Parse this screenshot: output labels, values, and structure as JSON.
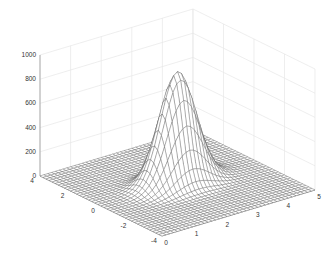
{
  "chart_data": {
    "type": "surface3d",
    "title": "",
    "xlabel": "",
    "ylabel": "",
    "zlabel": "",
    "xlim": [
      0,
      5
    ],
    "ylim": [
      -4,
      4
    ],
    "zlim": [
      0,
      1000
    ],
    "x_ticks": [
      0,
      1,
      2,
      3,
      4,
      5
    ],
    "y_ticks": [
      -4,
      -2,
      0,
      2,
      4
    ],
    "z_ticks": [
      0,
      200,
      400,
      600,
      800,
      1000
    ],
    "grid": true,
    "surface": {
      "description": "Single Gaussian-like peak on a flat plane, drawn as a wireframe mesh",
      "function": "z = A * exp(-((x - x0)^2 + (y - y0)^2) / (2*sigma^2))",
      "peak_amplitude": 920,
      "peak_x": 2.5,
      "peak_y": 0,
      "sigma": 0.55,
      "mesh_resolution": [
        41,
        41
      ],
      "base_value": 0
    },
    "colors": {
      "mesh_line": "#555555",
      "grid": "#e6e6e6",
      "axis": "#999999"
    }
  }
}
